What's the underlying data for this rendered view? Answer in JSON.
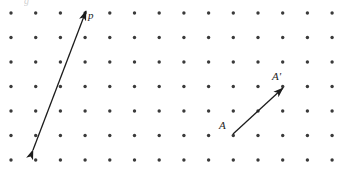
{
  "figure": {
    "name": "lattice-vector-diagram",
    "width": 341,
    "height": 170,
    "background_color": "#ffffff",
    "ink_color": "#1c1c1c",
    "dot_color": "#3a3a3a"
  },
  "lattice": {
    "columns": 14,
    "rows": 7,
    "origin_x": 11,
    "origin_y": 13,
    "spacing_x": 24.7,
    "spacing_y": 24.5,
    "dot_radius": 1.7
  },
  "vectors": [
    {
      "id": "vector-p",
      "label": "p",
      "label_x": 88,
      "label_y": 10,
      "arrowheads": "double",
      "x1": 33,
      "y1": 150,
      "x2": 86,
      "y2": 11,
      "stroke_width": 1.3
    },
    {
      "id": "vector-a-aprime",
      "label_start": "A",
      "label_end": "A'",
      "label_start_x": 219,
      "label_start_y": 120,
      "label_end_x": 272,
      "label_end_y": 71,
      "arrowheads": "single",
      "x1": 233,
      "y1": 134,
      "x2": 283,
      "y2": 88,
      "stroke_width": 1.3
    }
  ],
  "clipped_top_mark": {
    "text": "g",
    "x": 24,
    "y": -4
  }
}
